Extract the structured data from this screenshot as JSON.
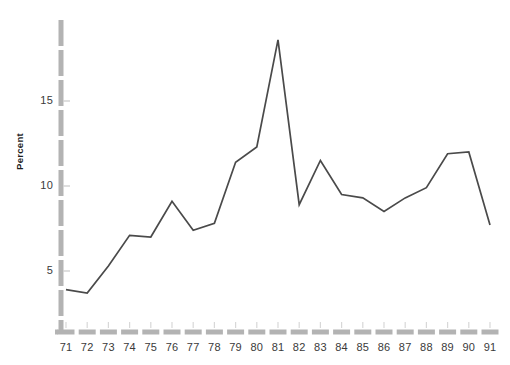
{
  "chart_data": {
    "type": "line",
    "title": "",
    "xlabel": "",
    "ylabel": "Percent",
    "categories": [
      "71",
      "72",
      "73",
      "74",
      "75",
      "76",
      "77",
      "78",
      "79",
      "80",
      "81",
      "82",
      "83",
      "84",
      "85",
      "86",
      "87",
      "88",
      "89",
      "90",
      "91"
    ],
    "values": [
      3.9,
      3.7,
      5.3,
      7.1,
      7.0,
      9.1,
      7.4,
      7.8,
      11.4,
      12.3,
      18.6,
      8.9,
      11.5,
      9.5,
      9.3,
      8.5,
      9.3,
      9.9,
      11.9,
      12.0,
      7.7
    ],
    "series": [
      {
        "name": "Percent",
        "values": [
          3.9,
          3.7,
          5.3,
          7.1,
          7.0,
          9.1,
          7.4,
          7.8,
          11.4,
          12.3,
          18.6,
          8.9,
          11.5,
          9.5,
          9.3,
          8.5,
          9.3,
          9.9,
          11.9,
          12.0,
          7.7
        ]
      }
    ],
    "ylim": [
      0,
      19.5
    ],
    "yticks": [
      5,
      10,
      15
    ],
    "ytick_labels": [
      "5",
      "10",
      "15"
    ],
    "xtick_labels": [
      "71",
      "72",
      "73",
      "74",
      "75",
      "76",
      "77",
      "78",
      "79",
      "80",
      "81",
      "82",
      "83",
      "84",
      "85",
      "86",
      "87",
      "88",
      "89",
      "90",
      "91"
    ],
    "grid": false,
    "legend": "none",
    "line_color": "#4a4a4a",
    "axis_color": "#b3b3b3",
    "tick_label_color": "#3a3a3a",
    "background_color": "#ffffff",
    "axis_style": "dashed-thick"
  }
}
